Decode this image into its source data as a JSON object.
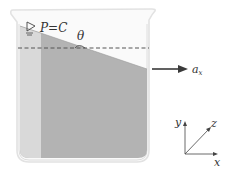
{
  "diagram": {
    "labels": {
      "pressure": "P=C",
      "angle": "θ",
      "acceleration": "a",
      "acceleration_sub": "x",
      "axis_x": "x",
      "axis_y": "y",
      "axis_z": "z"
    },
    "colors": {
      "liquid": "#b3b3b3",
      "liquid_light_strip": "#dcdcdc",
      "beaker_outline": "#e4e4e4",
      "arrow": "#3a3a3a",
      "dashed_line": "#555555",
      "text": "#333333"
    },
    "icons": {
      "free_surface": "triangle-down-surface-icon"
    }
  }
}
